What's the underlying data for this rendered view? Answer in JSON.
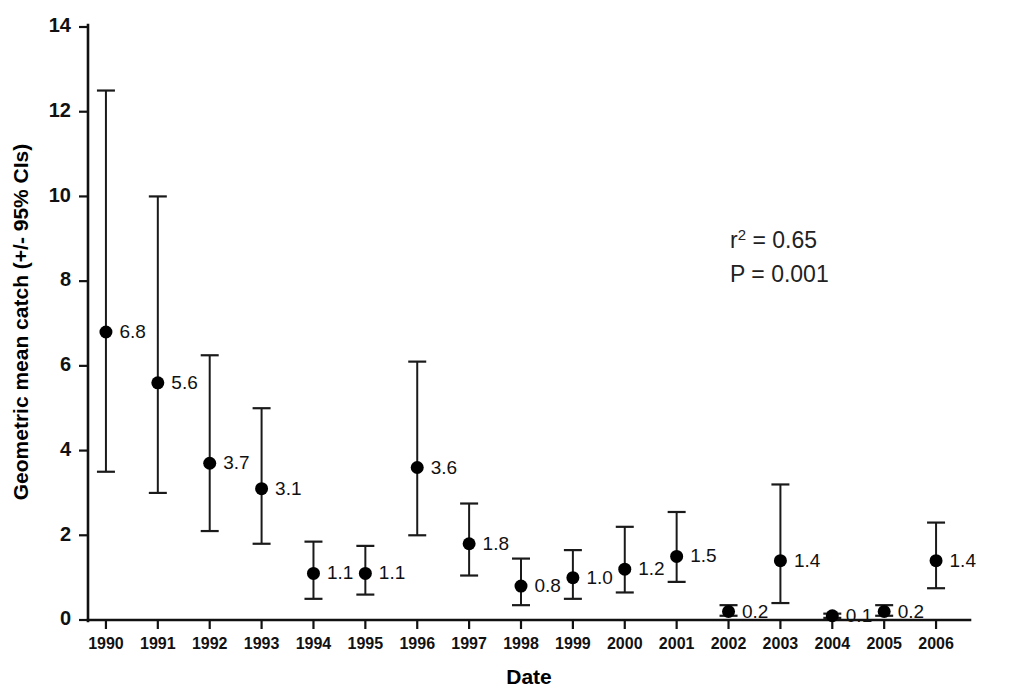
{
  "chart_data": {
    "type": "scatter",
    "title": "",
    "xlabel": "Date",
    "ylabel": "Geometric mean catch (+/- 95% CIs)",
    "xlim": [
      1989.5,
      2006.5
    ],
    "ylim": [
      0,
      14
    ],
    "grid": false,
    "legend": "none",
    "y_ticks": [
      0,
      2,
      4,
      6,
      8,
      10,
      12,
      14
    ],
    "y_tick_labels": [
      "0",
      "2",
      "4",
      "6",
      "8",
      "10",
      "12",
      "14"
    ],
    "x_ticks": [
      1990,
      1991,
      1992,
      1993,
      1994,
      1995,
      1996,
      1997,
      1998,
      1999,
      2000,
      2001,
      2002,
      2003,
      2004,
      2005,
      2006
    ],
    "categories": [
      "1990",
      "1991",
      "1992",
      "1993",
      "1994",
      "1995",
      "1996",
      "1997",
      "1998",
      "1999",
      "2000",
      "2001",
      "2002",
      "2003",
      "2004",
      "2005",
      "2006"
    ],
    "values": [
      6.8,
      5.6,
      3.7,
      3.1,
      1.1,
      1.1,
      3.6,
      1.8,
      0.8,
      1.0,
      1.2,
      1.5,
      0.2,
      1.4,
      0.1,
      0.2,
      1.4
    ],
    "data_labels": [
      "6.8",
      "5.6",
      "3.7",
      "3.1",
      "1.1",
      "1.1",
      "3.6",
      "1.8",
      "0.8",
      "1.0",
      "1.2",
      "1.5",
      "0.2",
      "1.4",
      "0.1",
      "0.2",
      "1.4"
    ],
    "error_low": [
      3.5,
      3.0,
      2.1,
      1.8,
      0.5,
      0.6,
      2.0,
      1.05,
      0.35,
      0.5,
      0.65,
      0.9,
      0.1,
      0.4,
      0.05,
      0.1,
      0.75
    ],
    "error_high": [
      12.5,
      10.0,
      6.25,
      5.0,
      1.85,
      1.75,
      6.1,
      2.75,
      1.45,
      1.65,
      2.2,
      2.55,
      0.35,
      3.2,
      0.15,
      0.35,
      2.3
    ],
    "points": [
      {
        "x": "1990",
        "y": 6.8,
        "lo": 3.5,
        "hi": 12.5,
        "label": "6.8"
      },
      {
        "x": "1991",
        "y": 5.6,
        "lo": 3.0,
        "hi": 10.0,
        "label": "5.6"
      },
      {
        "x": "1992",
        "y": 3.7,
        "lo": 2.1,
        "hi": 6.25,
        "label": "3.7"
      },
      {
        "x": "1993",
        "y": 3.1,
        "lo": 1.8,
        "hi": 5.0,
        "label": "3.1"
      },
      {
        "x": "1994",
        "y": 1.1,
        "lo": 0.5,
        "hi": 1.85,
        "label": "1.1"
      },
      {
        "x": "1995",
        "y": 1.1,
        "lo": 0.6,
        "hi": 1.75,
        "label": "1.1"
      },
      {
        "x": "1996",
        "y": 3.6,
        "lo": 2.0,
        "hi": 6.1,
        "label": "3.6"
      },
      {
        "x": "1997",
        "y": 1.8,
        "lo": 1.05,
        "hi": 2.75,
        "label": "1.8"
      },
      {
        "x": "1998",
        "y": 0.8,
        "lo": 0.35,
        "hi": 1.45,
        "label": "0.8"
      },
      {
        "x": "1999",
        "y": 1.0,
        "lo": 0.5,
        "hi": 1.65,
        "label": "1.0"
      },
      {
        "x": "2000",
        "y": 1.2,
        "lo": 0.65,
        "hi": 2.2,
        "label": "1.2"
      },
      {
        "x": "2001",
        "y": 1.5,
        "lo": 0.9,
        "hi": 2.55,
        "label": "1.5"
      },
      {
        "x": "2002",
        "y": 0.2,
        "lo": 0.1,
        "hi": 0.35,
        "label": "0.2"
      },
      {
        "x": "2003",
        "y": 1.4,
        "lo": 0.4,
        "hi": 3.2,
        "label": "1.4"
      },
      {
        "x": "2004",
        "y": 0.1,
        "lo": 0.05,
        "hi": 0.15,
        "label": "0.1"
      },
      {
        "x": "2005",
        "y": 0.2,
        "lo": 0.1,
        "hi": 0.35,
        "label": "0.2"
      },
      {
        "x": "2006",
        "y": 1.4,
        "lo": 0.75,
        "hi": 2.3,
        "label": "1.4"
      }
    ],
    "annotations": [
      {
        "name": "r-squared",
        "prefix": "r",
        "superscript": "2",
        "suffix": " = 0.65"
      },
      {
        "name": "p-value",
        "prefix": "P",
        "superscript": "",
        "suffix": " = 0.001"
      }
    ],
    "marker_color": "#000000",
    "errorbar_color": "#1a1a1a",
    "axis_color": "#111111",
    "background_color": "#ffffff"
  }
}
